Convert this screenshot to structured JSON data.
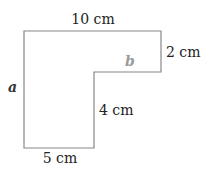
{
  "diagram": {
    "shape": "L-shaped polygon",
    "stroke_color": "#888888",
    "labels": {
      "top": "10 cm",
      "right": "2 cm",
      "inner_vertical": "4 cm",
      "bottom": "5 cm",
      "left_var": "a",
      "inner_horizontal_var": "b"
    },
    "colors": {
      "text": "#222222",
      "var_a": "#333333",
      "var_b": "#9a9a9a"
    }
  }
}
